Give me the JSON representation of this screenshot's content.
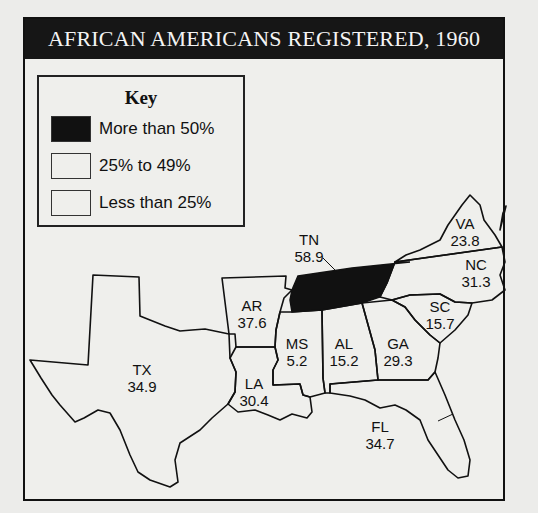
{
  "title": "AFRICAN AMERICANS REGISTERED, 1960",
  "key": {
    "title": "Key",
    "items": [
      {
        "label": "More than 50%",
        "color": "#111111"
      },
      {
        "label": "25% to 49%",
        "color": "#efefec"
      },
      {
        "label": "Less than 25%",
        "color": "#efefec"
      }
    ]
  },
  "states": [
    {
      "abbr": "TX",
      "value": "34.9"
    },
    {
      "abbr": "AR",
      "value": "37.6"
    },
    {
      "abbr": "LA",
      "value": "30.4"
    },
    {
      "abbr": "MS",
      "value": "5.2"
    },
    {
      "abbr": "AL",
      "value": "15.2"
    },
    {
      "abbr": "GA",
      "value": "29.3"
    },
    {
      "abbr": "FL",
      "value": "34.7"
    },
    {
      "abbr": "SC",
      "value": "15.7"
    },
    {
      "abbr": "NC",
      "value": "31.3"
    },
    {
      "abbr": "VA",
      "value": "23.8"
    },
    {
      "abbr": "TN",
      "value": "58.9"
    }
  ],
  "colors": {
    "highlight": "#111111",
    "background": "#efefec",
    "title_bar": "#161616"
  }
}
